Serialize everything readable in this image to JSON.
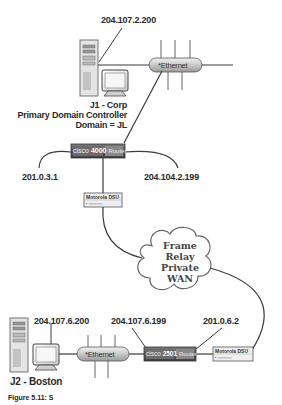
{
  "diagram": {
    "type": "network-topology",
    "sites": [
      {
        "name": "J1 - Corp",
        "role": "Primary Domain Controller",
        "domain": "Domain = JL",
        "server_ip": "204.107.2.200",
        "lan": "*Ethernet",
        "router": {
          "label": "cisco 4000 Router",
          "brand": "cisco",
          "model": "4000",
          "suffix": "Router",
          "left_ip": "201.0.3.1",
          "right_ip": "204.104.2.199"
        },
        "dsu": {
          "label": "Motorola DSU"
        }
      },
      {
        "name": "J2 - Boston",
        "server_ip": "204.107.6.200",
        "lan": "*Ethernet",
        "router": {
          "label": "cisco 2501 Router",
          "brand": "cisco",
          "model": "2501",
          "suffix": "Router",
          "lan_ip": "204.107.6.199",
          "wan_ip": "201.0.6.2"
        },
        "dsu": {
          "label": "Motorola DSU"
        }
      }
    ],
    "wan": {
      "lines": [
        "Frame",
        "Relay",
        "Private",
        "WAN"
      ]
    },
    "caption": "Figure 5.11: S"
  },
  "labels": {
    "j1_ip": "204.107.2.200",
    "j1_name": "J1 - Corp",
    "j1_role": "Primary Domain Controller",
    "j1_domain": "Domain = JL",
    "eth1": "*Ethernet",
    "router1_brand": "cisco",
    "router1_model": "4000",
    "router1_suffix": "Router",
    "router1_left_ip": "201.0.3.1",
    "router1_right_ip": "204.104.2.199",
    "dsu1": "Motorola DSU",
    "dsu1_dots": "▪ ▫▫▫▫▫▫▫▫▫▫",
    "cloud_l1": "Frame",
    "cloud_l2": "Relay",
    "cloud_l3": "Private",
    "cloud_l4": "WAN",
    "j2_ip": "204.107.6.200",
    "j2_name": "J2 - Boston",
    "eth2": "*Ethernet",
    "router2_brand": "cisco",
    "router2_model": "2501",
    "router2_suffix": "Router",
    "router2_lan_ip": "204.107.6.199",
    "router2_wan_ip": "201.0.6.2",
    "dsu2": "Motorola DSU",
    "dsu2_dots": "▪ ▫▫▫▫▫▫▫▫▫▫",
    "caption": "Figure 5.11: S"
  },
  "colors": {
    "line": "#3a3a3a",
    "router_fill": "#5a5a5a",
    "ethernet_fill": "#d6d6d6",
    "dsu_fill": "#e8e8e8",
    "cloud_fill": "#ffffff"
  }
}
